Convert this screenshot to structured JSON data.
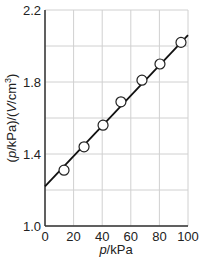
{
  "chart_data": {
    "type": "scatter",
    "title": "",
    "xlabel": "p/kPa",
    "ylabel": "(p/kPa)/(V/cm³)",
    "xlim": [
      0,
      100
    ],
    "ylim": [
      1.0,
      2.2
    ],
    "xticks": [
      0,
      20,
      40,
      60,
      80,
      100
    ],
    "yticks": [
      1.0,
      1.4,
      1.8,
      2.2
    ],
    "xtick_labels": [
      "0",
      "20",
      "40",
      "60",
      "80",
      "100"
    ],
    "ytick_labels": [
      "1.0",
      "1.4",
      "1.8",
      "2.2"
    ],
    "grid": true,
    "series": [
      {
        "name": "data",
        "marker": "open-circle",
        "x": [
          13.3,
          27.3,
          40.6,
          53.1,
          67.8,
          80.4,
          95.1
        ],
        "y": [
          1.31,
          1.44,
          1.56,
          1.69,
          1.81,
          1.9,
          2.02
        ]
      }
    ],
    "fit_line": {
      "x": [
        0,
        100
      ],
      "y": [
        1.22,
        2.06
      ]
    },
    "colors": {
      "line": "#111111",
      "grid": "#d0d0d0",
      "marker_fill": "#ffffff"
    }
  }
}
